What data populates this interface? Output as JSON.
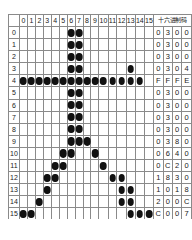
{
  "grid": {
    "column_headers": [
      "0",
      "1",
      "2",
      "3",
      "4",
      "5",
      "6",
      "7",
      "8",
      "9",
      "10",
      "11",
      "12",
      "13",
      "14",
      "15"
    ],
    "row_headers": [
      "0",
      "1",
      "2",
      "3",
      "4",
      "5",
      "6",
      "7",
      "8",
      "9",
      "10",
      "11",
      "12",
      "13",
      "14",
      "15"
    ],
    "corner_label": "",
    "rows": [
      {
        "label": "0",
        "bits": [
          0,
          0,
          0,
          0,
          0,
          0,
          1,
          1,
          0,
          0,
          0,
          0,
          0,
          0,
          0,
          0
        ],
        "hex": [
          "0",
          "3",
          "0",
          "0"
        ]
      },
      {
        "label": "1",
        "bits": [
          0,
          0,
          0,
          0,
          0,
          0,
          1,
          1,
          0,
          0,
          0,
          0,
          0,
          0,
          0,
          0
        ],
        "hex": [
          "0",
          "3",
          "0",
          "0"
        ]
      },
      {
        "label": "2",
        "bits": [
          0,
          0,
          0,
          0,
          0,
          0,
          1,
          1,
          0,
          0,
          0,
          0,
          0,
          0,
          0,
          0
        ],
        "hex": [
          "0",
          "3",
          "0",
          "0"
        ]
      },
      {
        "label": "3",
        "bits": [
          0,
          0,
          0,
          0,
          0,
          0,
          1,
          1,
          0,
          0,
          0,
          0,
          0,
          1,
          0,
          0
        ],
        "hex": [
          "0",
          "3",
          "0",
          "4"
        ]
      },
      {
        "label": "4",
        "bits": [
          1,
          1,
          1,
          1,
          1,
          1,
          1,
          1,
          1,
          1,
          1,
          1,
          1,
          1,
          1,
          0
        ],
        "hex": [
          "F",
          "F",
          "F",
          "E"
        ]
      },
      {
        "label": "5",
        "bits": [
          0,
          0,
          0,
          0,
          0,
          0,
          1,
          1,
          0,
          0,
          0,
          0,
          0,
          0,
          0,
          0
        ],
        "hex": [
          "0",
          "3",
          "0",
          "0"
        ]
      },
      {
        "label": "6",
        "bits": [
          0,
          0,
          0,
          0,
          0,
          0,
          1,
          1,
          0,
          0,
          0,
          0,
          0,
          0,
          0,
          0
        ],
        "hex": [
          "0",
          "3",
          "0",
          "0"
        ]
      },
      {
        "label": "7",
        "bits": [
          0,
          0,
          0,
          0,
          0,
          0,
          1,
          1,
          0,
          0,
          0,
          0,
          0,
          0,
          0,
          0
        ],
        "hex": [
          "0",
          "3",
          "0",
          "0"
        ]
      },
      {
        "label": "8",
        "bits": [
          0,
          0,
          0,
          0,
          0,
          0,
          1,
          1,
          0,
          0,
          0,
          0,
          0,
          0,
          0,
          0
        ],
        "hex": [
          "0",
          "3",
          "0",
          "0"
        ]
      },
      {
        "label": "9",
        "bits": [
          0,
          0,
          0,
          0,
          0,
          0,
          1,
          1,
          1,
          0,
          0,
          0,
          0,
          0,
          0,
          0
        ],
        "hex": [
          "0",
          "3",
          "8",
          "0"
        ]
      },
      {
        "label": "10",
        "bits": [
          0,
          0,
          0,
          0,
          0,
          1,
          1,
          0,
          0,
          1,
          0,
          0,
          0,
          0,
          0,
          0
        ],
        "hex": [
          "0",
          "6",
          "4",
          "0"
        ]
      },
      {
        "label": "11",
        "bits": [
          0,
          0,
          0,
          0,
          1,
          1,
          0,
          0,
          0,
          0,
          1,
          0,
          0,
          0,
          0,
          0
        ],
        "hex": [
          "0",
          "C",
          "2",
          "0"
        ]
      },
      {
        "label": "12",
        "bits": [
          0,
          0,
          0,
          1,
          1,
          0,
          0,
          0,
          0,
          0,
          0,
          1,
          1,
          0,
          0,
          0
        ],
        "hex": [
          "1",
          "8",
          "3",
          "0"
        ]
      },
      {
        "label": "13",
        "bits": [
          0,
          0,
          0,
          1,
          0,
          0,
          0,
          0,
          0,
          0,
          0,
          0,
          1,
          1,
          0,
          0
        ],
        "hex": [
          "1",
          "0",
          "1",
          "8"
        ]
      },
      {
        "label": "14",
        "bits": [
          0,
          0,
          1,
          0,
          0,
          0,
          0,
          0,
          0,
          0,
          0,
          0,
          1,
          1,
          0,
          0
        ],
        "hex": [
          "2",
          "0",
          "0",
          "C"
        ]
      },
      {
        "label": "15",
        "bits": [
          1,
          1,
          0,
          0,
          0,
          0,
          0,
          0,
          0,
          0,
          0,
          0,
          0,
          1,
          1,
          1
        ],
        "hex": [
          "C",
          "0",
          "0",
          "7"
        ]
      }
    ],
    "hex_header": "十六进制码"
  },
  "colors": {
    "dot": "#111111",
    "gridline": "#8a8a8a",
    "background": "#ffffff",
    "text": "#1a1a1a"
  }
}
